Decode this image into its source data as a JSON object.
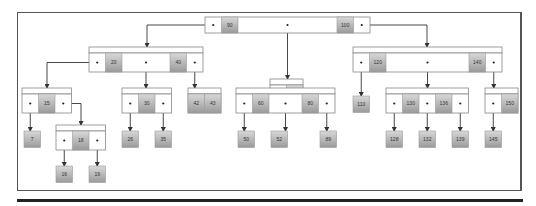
{
  "diagram": {
    "type": "b-tree",
    "root": {
      "id": "root",
      "keys": [
        "90",
        "100"
      ]
    },
    "nodes": [
      {
        "id": "root",
        "keys": [
          "90",
          "100"
        ],
        "children": [
          "n-20-40",
          "n-75",
          "n-120-140"
        ]
      },
      {
        "id": "n-20-40",
        "keys": [
          "20",
          "40"
        ],
        "children": [
          "n-15",
          "n-30",
          "n-42-43"
        ]
      },
      {
        "id": "n-75",
        "keys": [
          "75"
        ],
        "children": [
          "n-60-80"
        ]
      },
      {
        "id": "n-120-140",
        "keys": [
          "120",
          "140"
        ],
        "children": [
          "leaf-110",
          "n-130-136",
          "n-150"
        ]
      },
      {
        "id": "n-15",
        "keys": [
          "15"
        ],
        "children": [
          "leaf-7",
          "n-18"
        ]
      },
      {
        "id": "n-30",
        "keys": [
          "30"
        ],
        "children": [
          "leaf-26",
          "leaf-35"
        ]
      },
      {
        "id": "n-42-43",
        "keys": [
          "42",
          "43"
        ],
        "children": []
      },
      {
        "id": "n-60-80",
        "keys": [
          "60",
          "80"
        ],
        "children": [
          "leaf-50",
          "leaf-52",
          "leaf-89"
        ]
      },
      {
        "id": "leaf-110",
        "keys": [
          "110"
        ],
        "children": []
      },
      {
        "id": "n-130-136",
        "keys": [
          "130",
          "136"
        ],
        "children": [
          "leaf-128",
          "leaf-132",
          "leaf-139"
        ]
      },
      {
        "id": "n-150",
        "keys": [
          "150"
        ],
        "children": [
          "leaf-145"
        ]
      },
      {
        "id": "n-18",
        "keys": [
          "18"
        ],
        "children": [
          "leaf-16",
          "leaf-19"
        ]
      },
      {
        "id": "leaf-7",
        "keys": [
          "7"
        ]
      },
      {
        "id": "leaf-26",
        "keys": [
          "26"
        ]
      },
      {
        "id": "leaf-35",
        "keys": [
          "35"
        ]
      },
      {
        "id": "leaf-50",
        "keys": [
          "50"
        ]
      },
      {
        "id": "leaf-52",
        "keys": [
          "52"
        ]
      },
      {
        "id": "leaf-89",
        "keys": [
          "89"
        ]
      },
      {
        "id": "leaf-128",
        "keys": [
          "128"
        ]
      },
      {
        "id": "leaf-132",
        "keys": [
          "132"
        ]
      },
      {
        "id": "leaf-139",
        "keys": [
          "139"
        ]
      },
      {
        "id": "leaf-145",
        "keys": [
          "145"
        ]
      },
      {
        "id": "leaf-16",
        "keys": [
          "16"
        ]
      },
      {
        "id": "leaf-19",
        "keys": [
          "19"
        ]
      }
    ],
    "colors": {
      "key_fill_top": "#d8d8d8",
      "key_fill_bottom": "#9a9a9a",
      "border": "#888888",
      "edge": "#333333"
    }
  }
}
